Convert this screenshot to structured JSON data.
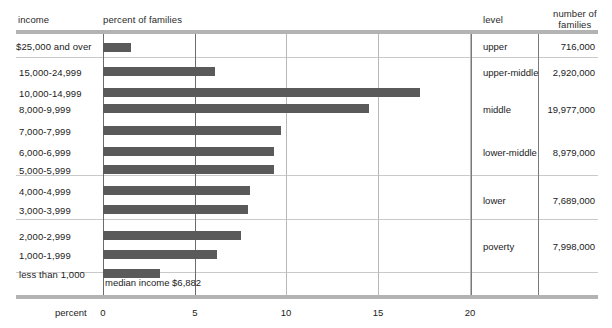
{
  "headers": {
    "income": "income",
    "percent_of_families": "percent of families",
    "level": "level",
    "number_of_families_line1": "number of",
    "number_of_families_line2": "families"
  },
  "axis": {
    "name": "percent",
    "ticks": [
      "0",
      "5",
      "10",
      "15",
      "20"
    ]
  },
  "annotation": {
    "median": "median income $6,882"
  },
  "colors": {
    "bar": "#5a5a5a",
    "rule": "#b3b3b3",
    "gridline": "#6b6b6b",
    "separator": "#c9c9c9"
  },
  "rows": [
    {
      "income": "$25,000 and over",
      "percent": 1.5
    },
    {
      "income": "15,000-24,999",
      "percent": 6.1
    },
    {
      "income": "10,000-14,999",
      "percent": 17.3
    },
    {
      "income": "8,000-9,999",
      "percent": 14.5
    },
    {
      "income": "7,000-7,999",
      "percent": 9.7
    },
    {
      "income": "6,000-6,999",
      "percent": 9.3
    },
    {
      "income": "5,000-5,999",
      "percent": 9.3
    },
    {
      "income": "4,000-4,999",
      "percent": 8.0
    },
    {
      "income": "3,000-3,999",
      "percent": 7.9
    },
    {
      "income": "2,000-2,999",
      "percent": 7.5
    },
    {
      "income": "1,000-1,999",
      "percent": 6.2
    },
    {
      "income": "less than 1,000",
      "percent": 3.1
    }
  ],
  "levels": [
    {
      "label": "upper",
      "families": "716,000"
    },
    {
      "label": "upper-middle",
      "families": "2,920,000"
    },
    {
      "label": "middle",
      "families": "19,977,000"
    },
    {
      "label": "lower-middle",
      "families": "8,979,000"
    },
    {
      "label": "lower",
      "families": "7,689,000"
    },
    {
      "label": "poverty",
      "families": "7,998,000"
    }
  ],
  "chart_data": {
    "type": "bar",
    "title": "",
    "orientation": "horizontal",
    "xlabel": "percent",
    "ylabel": "income",
    "xlim": [
      0,
      22
    ],
    "xticks": [
      0,
      5,
      10,
      15,
      20
    ],
    "grid": "vertical",
    "legend": "none",
    "categories": [
      "$25,000 and over",
      "15,000-24,999",
      "10,000-14,999",
      "8,000-9,999",
      "7,000-7,999",
      "6,000-6,999",
      "5,000-5,999",
      "4,000-4,999",
      "3,000-3,999",
      "2,000-2,999",
      "1,000-1,999",
      "less than 1,000"
    ],
    "values": [
      1.5,
      6.1,
      17.3,
      14.5,
      9.7,
      9.3,
      9.3,
      8.0,
      7.9,
      7.5,
      6.2,
      3.1
    ],
    "series": [
      {
        "name": "percent of families",
        "values": [
          1.5,
          6.1,
          17.3,
          14.5,
          9.7,
          9.3,
          9.3,
          8.0,
          7.9,
          7.5,
          6.2,
          3.1
        ]
      }
    ],
    "annotations": [
      "median income $6,882"
    ],
    "side_table": {
      "columns": [
        "level",
        "number of families"
      ],
      "rows": [
        [
          "upper",
          "716,000"
        ],
        [
          "upper-middle",
          "2,920,000"
        ],
        [
          "middle",
          "19,977,000"
        ],
        [
          "lower-middle",
          "8,979,000"
        ],
        [
          "lower",
          "7,689,000"
        ],
        [
          "poverty",
          "7,998,000"
        ]
      ]
    }
  }
}
